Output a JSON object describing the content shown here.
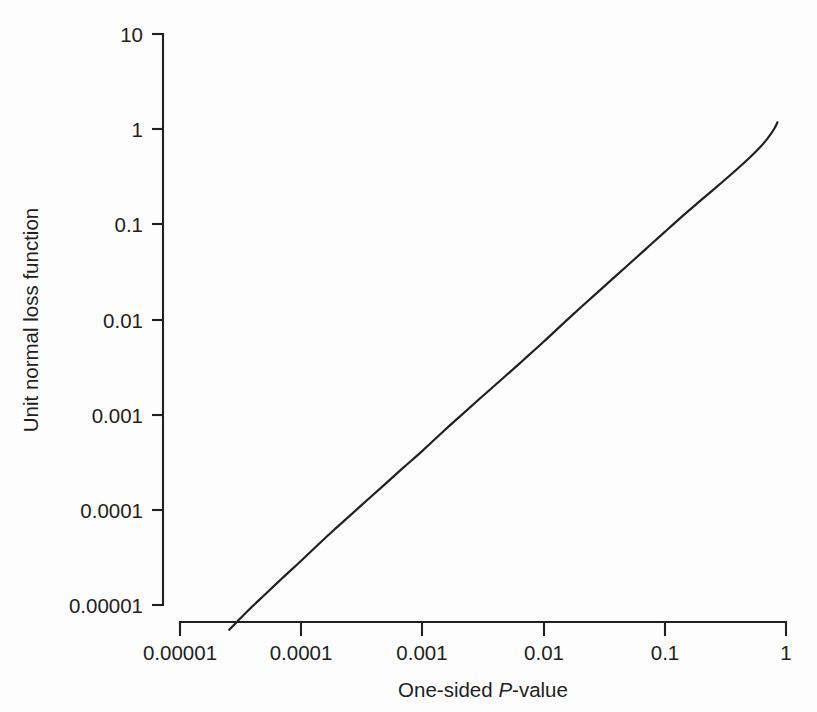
{
  "chart_data": {
    "type": "line",
    "title": "",
    "subtitle": "",
    "xlabel_parts": [
      "One-sided ",
      "P",
      "-value"
    ],
    "xlabel": "One-sided P-value",
    "ylabel": "Unit normal loss function",
    "xscale": "log",
    "yscale": "log",
    "xlim": [
      1e-05,
      1
    ],
    "ylim": [
      1e-05,
      10
    ],
    "grid": false,
    "legend": null,
    "xticks": [
      "0.00001",
      "0.0001",
      "0.001",
      "0.01",
      "0.1",
      "1"
    ],
    "xtick_values": [
      1e-05,
      0.0001,
      0.001,
      0.01,
      0.1,
      1
    ],
    "yticks": [
      "0.00001",
      "0.0001",
      "0.001",
      "0.01",
      "0.1",
      "1",
      "10"
    ],
    "ytick_values": [
      1e-05,
      0.0001,
      0.001,
      0.01,
      0.1,
      1,
      10
    ],
    "series": [
      {
        "name": "Unit normal loss function",
        "color": "#231f20",
        "x": [
          2.55e-05,
          3e-05,
          4e-05,
          5e-05,
          7e-05,
          0.0001,
          0.00015,
          0.0002,
          0.0003,
          0.0005,
          0.0007,
          0.001,
          0.0015,
          0.002,
          0.003,
          0.005,
          0.007,
          0.01,
          0.015,
          0.02,
          0.03,
          0.05,
          0.07,
          0.1,
          0.15,
          0.2,
          0.3,
          0.4,
          0.5,
          0.6,
          0.7,
          0.8,
          0.85
        ],
        "y": [
          5.5e-06,
          6.8e-06,
          9.8e-06,
          1.28e-05,
          1.92e-05,
          2.92e-05,
          4.77e-05,
          6.66e-05,
          0.000106,
          0.00019,
          0.000279,
          0.000417,
          0.000674,
          0.000938,
          0.001486,
          0.002642,
          0.003868,
          0.005831,
          0.009442,
          0.0132,
          0.021,
          0.0376,
          0.0553,
          0.0833,
          0.132,
          0.1804,
          0.28,
          0.386,
          0.5,
          0.63,
          0.79,
          1.01,
          1.18
        ]
      }
    ],
    "annotations": []
  },
  "axes": {
    "x_axis_name": "x-axis",
    "y_axis_name": "y-axis"
  }
}
